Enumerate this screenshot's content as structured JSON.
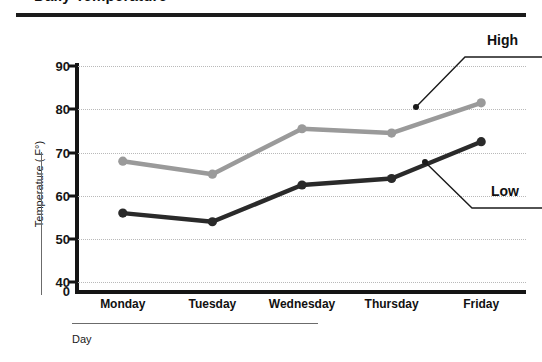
{
  "chart_data": {
    "type": "line",
    "title": "Daily Temperature",
    "xlabel": "Day",
    "ylabel": "Temperature ( F°)",
    "categories": [
      "Monday",
      "Tuesday",
      "Wednesday",
      "Thursday",
      "Friday"
    ],
    "series": [
      {
        "name": "High",
        "color": "#9a9a9a",
        "values": [
          68,
          65,
          75.5,
          74.5,
          81.5
        ]
      },
      {
        "name": "Low",
        "color": "#2a2a2a",
        "values": [
          56,
          54,
          62.5,
          64,
          72.5
        ]
      }
    ],
    "ylim": [
      0,
      90
    ],
    "y_ticks": [
      "0",
      "40",
      "50",
      "60",
      "70",
      "80",
      "90"
    ],
    "y_tick_values": [
      0,
      40,
      50,
      60,
      70,
      80,
      90
    ],
    "grid": true,
    "legend": "annotations",
    "annotations": [
      {
        "label": "High",
        "series": "High"
      },
      {
        "label": "Low",
        "series": "Low"
      }
    ]
  },
  "axis": {
    "y_title": "Temperature ( F°)",
    "x_title": "Day"
  },
  "colors": {
    "high_line": "#9a9a9a",
    "low_line": "#2a2a2a",
    "axis": "#151515",
    "grid": "#b9b9b9",
    "annotation_leader": "#1b1b1b"
  }
}
